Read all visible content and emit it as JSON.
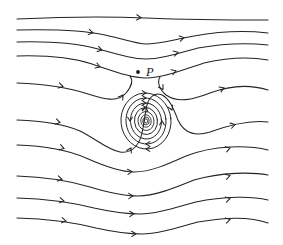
{
  "figure": {
    "kind": "streamline-diagram",
    "width": 283,
    "height": 245,
    "background_color": "#ffffff",
    "stroke_color": "#232323",
    "labels": [
      {
        "text": "P",
        "x": 146,
        "y": 66,
        "style": "italic-serif"
      }
    ],
    "markers": [
      {
        "name": "point-p",
        "x": 138,
        "y": 72,
        "radius": 1.9,
        "color": "#1a1a1a"
      }
    ]
  },
  "chart_data": {
    "type": "line",
    "title": "",
    "xlabel": "",
    "ylabel": "",
    "grid": false,
    "legend": null,
    "xlim": [
      0,
      283
    ],
    "ylim": [
      245,
      0
    ],
    "flow_direction": "left-to-right",
    "critical_points": [
      {
        "name": "vortex-center",
        "type": "center",
        "x": 146,
        "y": 121
      },
      {
        "name": "labeled-point-P",
        "type": "marked-point",
        "label": "P",
        "x": 138,
        "y": 72
      }
    ],
    "series": [
      {
        "name": "streamline-1",
        "path": "M 17,19 C 60,17 100,16 146,18 C 195,20 240,20 268,20",
        "arrows": [
          {
            "x": 141,
            "y": 17.6,
            "angle": 3
          }
        ]
      },
      {
        "name": "streamline-2",
        "path": "M 17,30 C 55,29 82,30 105,35 C 124,39 136,44 146,44 C 158,44 172,40 194,36 C 222,31 250,31 268,33",
        "arrows": [
          {
            "x": 93,
            "y": 32.9,
            "angle": 12
          },
          {
            "x": 184,
            "y": 37.6,
            "angle": -12
          }
        ]
      },
      {
        "name": "streamline-3",
        "path": "M 17,42 C 52,41 76,43 98,49 C 120,55 133,59 146,59 C 160,59 176,54 198,48 C 226,43 250,43 268,45",
        "arrows": [
          {
            "x": 102,
            "y": 50.2,
            "angle": 16
          },
          {
            "x": 178,
            "y": 52.3,
            "angle": -16
          }
        ]
      },
      {
        "name": "streamline-4",
        "path": "M 17,56 C 48,55 70,57 92,64 C 116,72 132,78 146,78 C 162,78 180,71 204,63 C 230,57 252,57 268,60",
        "arrows": [
          {
            "x": 100,
            "y": 67.0,
            "angle": 20
          },
          {
            "x": 176,
            "y": 70.8,
            "angle": -20
          }
        ]
      },
      {
        "name": "streamline-5-separatrix-left",
        "path": "M 17,83 C 48,84 70,88 88,94 C 104,99 118,103 126,93 C 132,86 133,80 130,76",
        "arrows": [
          {
            "x": 63,
            "y": 86.4,
            "angle": 12
          },
          {
            "x": 123,
            "y": 95.0,
            "angle": -55
          }
        ]
      },
      {
        "name": "streamline-5-separatrix-right",
        "path": "M 160,77 C 157,82 159,89 166,95 C 178,103 192,100 210,93 C 234,84 252,85 268,90",
        "arrows": [
          {
            "x": 163,
            "y": 89.5,
            "angle": 58
          },
          {
            "x": 224,
            "y": 87.8,
            "angle": -22
          }
        ]
      },
      {
        "name": "streamline-6",
        "path": "M 17,120 C 46,121 64,124 80,131 C 96,139 108,150 120,152 C 133,154 140,143 142,133 C 144,124 145,113 147,105 C 149,97 155,92 162,95 C 170,99 174,110 178,120 C 184,133 194,137 210,132 C 232,124 252,120 268,122",
        "arrows": [
          {
            "x": 60,
            "y": 122.6,
            "angle": 14
          },
          {
            "x": 131,
            "y": 148.0,
            "angle": -62
          },
          {
            "x": 146,
            "y": 107.0,
            "angle": -78
          },
          {
            "x": 172,
            "y": 110.0,
            "angle": 66
          },
          {
            "x": 235,
            "y": 124.5,
            "angle": -16
          }
        ]
      },
      {
        "name": "streamline-7",
        "path": "M 17,145 C 48,146 68,150 86,158 C 104,166 120,172 134,172 C 150,172 166,165 186,156 C 214,145 248,145 268,150",
        "arrows": [
          {
            "x": 64,
            "y": 148.4,
            "angle": 16
          },
          {
            "x": 132,
            "y": 171.6,
            "angle": -4
          },
          {
            "x": 230,
            "y": 148.0,
            "angle": -18
          }
        ]
      },
      {
        "name": "streamline-8",
        "path": "M 17,176 C 48,177 70,181 90,187 C 110,193 124,196 138,196 C 154,196 172,189 194,180 C 222,172 252,172 268,175",
        "arrows": [
          {
            "x": 62,
            "y": 179.3,
            "angle": 12
          },
          {
            "x": 133,
            "y": 195.8,
            "angle": -3
          },
          {
            "x": 230,
            "y": 175.6,
            "angle": -15
          }
        ]
      },
      {
        "name": "streamline-9",
        "path": "M 17,198 C 50,199 74,203 94,208 C 112,212 126,214 140,214 C 156,214 174,208 196,202 C 224,196 252,196 268,200",
        "arrows": [
          {
            "x": 64,
            "y": 201.0,
            "angle": 10
          },
          {
            "x": 134,
            "y": 213.8,
            "angle": -2
          },
          {
            "x": 230,
            "y": 198.6,
            "angle": -13
          }
        ]
      },
      {
        "name": "streamline-10",
        "path": "M 17,218 C 52,219 76,223 96,228 C 114,232 128,234 142,234 C 158,234 176,228 198,222 C 226,217 252,217 268,223",
        "arrows": [
          {
            "x": 66,
            "y": 221.0,
            "angle": 10
          },
          {
            "x": 136,
            "y": 233.8,
            "angle": -2
          },
          {
            "x": 230,
            "y": 219.5,
            "angle": -14
          }
        ]
      }
    ],
    "vortex": {
      "center": [
        146,
        121
      ],
      "rotation": "clockwise",
      "loops": [
        {
          "rx": 25,
          "ry": 28,
          "rot": -6,
          "arrows": [
            {
              "x": 146,
              "y": 93,
              "angle": 0
            },
            {
              "x": 146,
              "y": 149,
              "angle": 180
            }
          ]
        },
        {
          "rx": 20,
          "ry": 23,
          "rot": -6,
          "arrows": [
            {
              "x": 146,
              "y": 98,
              "angle": 0
            },
            {
              "x": 146,
              "y": 144,
              "angle": 180
            }
          ]
        },
        {
          "rx": 15.5,
          "ry": 18,
          "rot": -6,
          "arrows": [
            {
              "x": 146,
              "y": 103,
              "angle": 0
            },
            {
              "x": 130,
              "y": 121,
              "angle": 90
            }
          ]
        },
        {
          "rx": 11.5,
          "ry": 13.5,
          "rot": -6,
          "arrows": [
            {
              "x": 146,
              "y": 107.5,
              "angle": 0
            },
            {
              "x": 162,
              "y": 121,
              "angle": -90
            }
          ]
        },
        {
          "rx": 8,
          "ry": 9.5,
          "rot": -6,
          "arrows": []
        },
        {
          "rx": 5.2,
          "ry": 6.2,
          "rot": -6,
          "arrows": []
        },
        {
          "rx": 3.2,
          "ry": 3.8,
          "rot": -6,
          "arrows": []
        },
        {
          "rx": 1.8,
          "ry": 2.1,
          "rot": -6,
          "arrows": []
        }
      ]
    }
  }
}
